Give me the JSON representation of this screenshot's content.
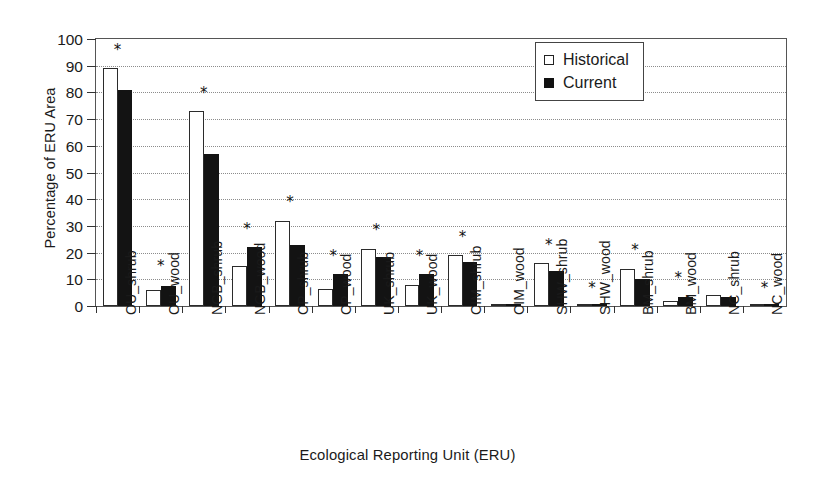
{
  "chart_data": {
    "type": "bar",
    "title": "",
    "xlabel": "Ecological Reporting Unit (ERU)",
    "ylabel": "Percentage of ERU Area",
    "ylim": [
      0,
      100
    ],
    "ytick_labels": [
      "0",
      "10",
      "20",
      "30",
      "40",
      "50",
      "60",
      "70",
      "80",
      "90",
      "100"
    ],
    "ytick_values": [
      0,
      10,
      20,
      30,
      40,
      50,
      60,
      70,
      80,
      90,
      100
    ],
    "grid": "horizontal-dotted",
    "legend_position": "top-right",
    "categories": [
      "OU_shrub",
      "OU_wood",
      "NGB_shrub",
      "NGB_wood",
      "CP_shrub",
      "CP_wood",
      "UK_shrub",
      "UK_wood",
      "CIM_shrub",
      "CIM_wood",
      "SHW_shrub",
      "SHW_wood",
      "BM_shrub",
      "BM_wood",
      "NC_shrub",
      "NC_wood"
    ],
    "series": [
      {
        "name": "Historical",
        "color": "#ffffff",
        "edge_color": "#2b2b2b",
        "values": [
          89,
          6,
          73,
          15,
          32,
          6.5,
          21.5,
          8,
          19,
          0,
          16,
          0.5,
          14,
          2,
          4,
          0.3
        ]
      },
      {
        "name": "Current",
        "color": "#131313",
        "edge_color": "#131313",
        "values": [
          81,
          7.5,
          57,
          22,
          23,
          12,
          18.5,
          12,
          16.5,
          0,
          13,
          0.3,
          10,
          3.5,
          3.5,
          0.3
        ]
      }
    ],
    "annotations": {
      "symbol": "*",
      "meaning": "significant-difference-marker",
      "marked_categories": [
        "OU_shrub",
        "OU_wood",
        "NGB_shrub",
        "NGB_wood",
        "CP_shrub",
        "CP_wood",
        "UK_shrub",
        "UK_wood",
        "CIM_shrub",
        "SHW_shrub",
        "SHW_wood",
        "BM_shrub",
        "BM_wood",
        "NC_wood"
      ],
      "star_heights": {
        "OU_shrub": 94,
        "OU_wood": 13,
        "NGB_shrub": 78,
        "NGB_wood": 27,
        "CP_shrub": 37,
        "CP_wood": 17,
        "UK_shrub": 26.5,
        "UK_wood": 17,
        "CIM_shrub": 24,
        "SHW_shrub": 21,
        "SHW_wood": 5,
        "BM_shrub": 19,
        "BM_wood": 8.5,
        "NC_wood": 5
      }
    }
  },
  "legend": {
    "items": [
      {
        "label": "Historical",
        "swatch": "open-square"
      },
      {
        "label": "Current",
        "swatch": "filled-square"
      }
    ]
  }
}
